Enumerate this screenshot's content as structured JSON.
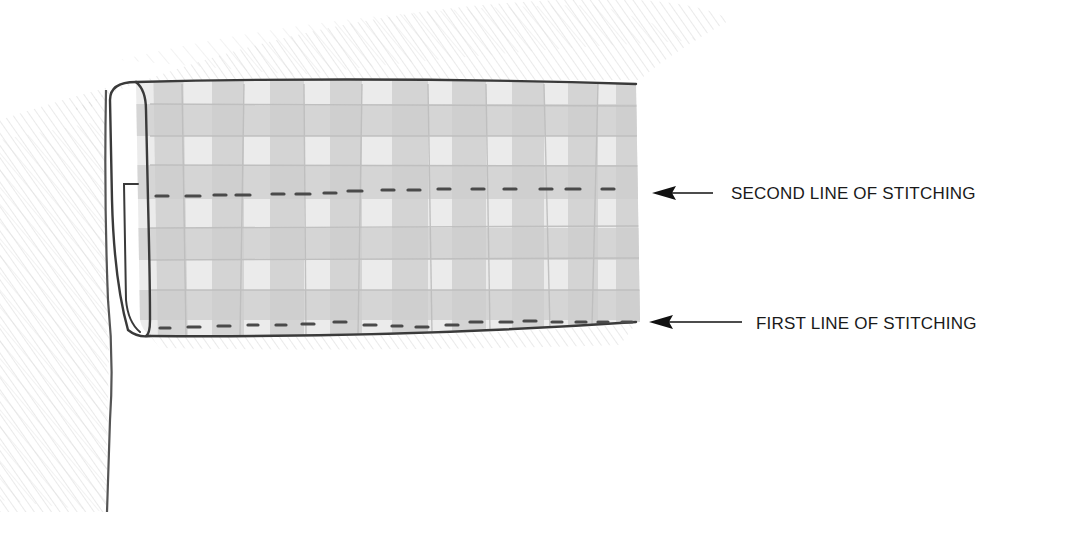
{
  "diagram": {
    "style": "pencil illustration",
    "colors": {
      "background": "#ffffff",
      "pencil_shading": "#d6d6d6",
      "gingham_dark": "#c9c9c9",
      "gingham_mid": "#dddddd",
      "outline": "#3a3a3a",
      "stitch": "#4a4a4a",
      "label_text": "#1a1a1a"
    },
    "callouts": [
      {
        "id": "second",
        "label": "SECOND LINE OF STITCHING",
        "arrow": "left-arrow"
      },
      {
        "id": "first",
        "label": "FIRST LINE OF STITCHING",
        "arrow": "left-arrow"
      }
    ]
  }
}
